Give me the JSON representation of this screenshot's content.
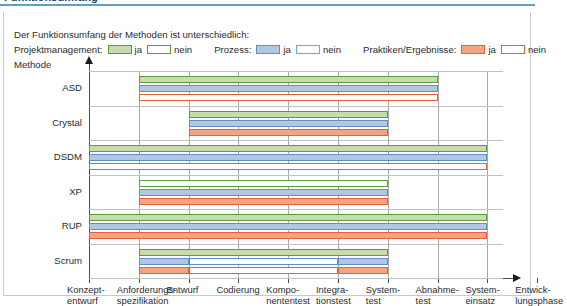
{
  "title": "Funktionsumfang",
  "caption": "Der Funktionsumfang der Methoden ist unterschiedlich:",
  "legend": {
    "groups": [
      {
        "label": "Projektmanagement:",
        "yes": "ja",
        "no": "nein",
        "color_yes": "#c6dcac",
        "color_border": "#5d9c3d"
      },
      {
        "label": "Prozess:",
        "yes": "ja",
        "no": "nein",
        "color_yes": "#b3c7e2",
        "color_border": "#5f8fc8"
      },
      {
        "label": "Praktiken/Ergebnisse:",
        "yes": "ja",
        "no": "nein",
        "color_yes": "#f7a382",
        "color_border": "#e2613a"
      }
    ]
  },
  "axis_title": "Methode",
  "chart_data": {
    "type": "bar",
    "title": "Funktionsumfang",
    "xlabel": "Entwicklungsphase",
    "ylabel": "Methode",
    "grid": true,
    "legend_position": "top",
    "x_ticks": [
      "Konzept-\nentwurf",
      "Anforderungs-\nspezifikation",
      "Entwurf",
      "Codierung",
      "Kompo-\nnententest",
      "Integra-\ntionstest",
      "System-\ntest",
      "Abnahme-\ntest",
      "System-\neinsatz",
      "Entwick-\nlungsphase"
    ],
    "x_tick_labels": [
      [
        "Konzept-",
        "entwurf"
      ],
      [
        "Anforderungs-",
        "spezifikation"
      ],
      [
        "Entwurf",
        ""
      ],
      [
        "Codierung",
        ""
      ],
      [
        "Kompo-",
        "nententest"
      ],
      [
        "Integra-",
        "tionstest"
      ],
      [
        "System-",
        "test"
      ],
      [
        "Abnahme-",
        "test"
      ],
      [
        "System-",
        "einsatz"
      ],
      [
        "Entwick-",
        "lungsphase"
      ]
    ],
    "categories": [
      "ASD",
      "Crystal",
      "DSDM",
      "XP",
      "RUP",
      "Scrum"
    ],
    "series": [
      {
        "name": "Projektmanagement",
        "key": "green"
      },
      {
        "name": "Prozess",
        "key": "blue"
      },
      {
        "name": "Praktiken/Ergebnisse",
        "key": "orange"
      }
    ],
    "methods": [
      {
        "name": "ASD",
        "bars": [
          {
            "series": "Projektmanagement",
            "color": "green",
            "segments": [
              {
                "from": 1,
                "to": 7,
                "filled": true
              }
            ]
          },
          {
            "series": "Prozess",
            "color": "blue",
            "segments": [
              {
                "from": 1,
                "to": 7,
                "filled": true
              }
            ]
          },
          {
            "series": "Praktiken/Ergebnisse",
            "color": "orange",
            "segments": [
              {
                "from": 1,
                "to": 7,
                "filled": false
              }
            ]
          }
        ]
      },
      {
        "name": "Crystal",
        "bars": [
          {
            "series": "Projektmanagement",
            "color": "green",
            "segments": [
              {
                "from": 2,
                "to": 6,
                "filled": true
              }
            ]
          },
          {
            "series": "Prozess",
            "color": "blue",
            "segments": [
              {
                "from": 2,
                "to": 6,
                "filled": true
              }
            ]
          },
          {
            "series": "Praktiken/Ergebnisse",
            "color": "orange",
            "segments": [
              {
                "from": 2,
                "to": 6,
                "filled": true
              }
            ]
          }
        ]
      },
      {
        "name": "DSDM",
        "bars": [
          {
            "series": "Projektmanagement",
            "color": "green",
            "segments": [
              {
                "from": 0,
                "to": 8,
                "filled": true
              }
            ]
          },
          {
            "series": "Prozess",
            "color": "blue",
            "segments": [
              {
                "from": 0,
                "to": 8,
                "filled": true
              }
            ]
          },
          {
            "series": "Praktiken/Ergebnisse",
            "color": "orange",
            "segments": [
              {
                "from": 0,
                "to": 8,
                "filled": false
              }
            ]
          }
        ]
      },
      {
        "name": "XP",
        "bars": [
          {
            "series": "Projektmanagement",
            "color": "green",
            "segments": [
              {
                "from": 1,
                "to": 6,
                "filled": false
              }
            ]
          },
          {
            "series": "Prozess",
            "color": "blue",
            "segments": [
              {
                "from": 1,
                "to": 6,
                "filled": true
              }
            ]
          },
          {
            "series": "Praktiken/Ergebnisse",
            "color": "orange",
            "segments": [
              {
                "from": 1,
                "to": 6,
                "filled": true
              }
            ]
          }
        ]
      },
      {
        "name": "RUP",
        "bars": [
          {
            "series": "Projektmanagement",
            "color": "green",
            "segments": [
              {
                "from": 0,
                "to": 8,
                "filled": true
              }
            ]
          },
          {
            "series": "Prozess",
            "color": "blue",
            "segments": [
              {
                "from": 0,
                "to": 8,
                "filled": true
              }
            ]
          },
          {
            "series": "Praktiken/Ergebnisse",
            "color": "orange",
            "segments": [
              {
                "from": 0,
                "to": 8,
                "filled": true
              }
            ]
          }
        ]
      },
      {
        "name": "Scrum",
        "bars": [
          {
            "series": "Projektmanagement",
            "color": "green",
            "segments": [
              {
                "from": 1,
                "to": 6,
                "filled": true
              }
            ]
          },
          {
            "series": "Prozess",
            "color": "blue",
            "segments": [
              {
                "from": 1,
                "to": 2,
                "filled": true
              },
              {
                "from": 2,
                "to": 5,
                "filled": false
              },
              {
                "from": 5,
                "to": 6,
                "filled": true
              }
            ]
          },
          {
            "series": "Praktiken/Ergebnisse",
            "color": "orange",
            "segments": [
              {
                "from": 1,
                "to": 2,
                "filled": true
              },
              {
                "from": 2,
                "to": 5,
                "filled": false
              },
              {
                "from": 5,
                "to": 6,
                "filled": true
              }
            ]
          }
        ]
      }
    ]
  }
}
